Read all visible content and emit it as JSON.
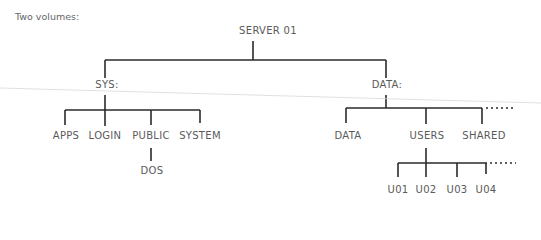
{
  "caption": "Two volumes:",
  "root": {
    "label": "SERVER 01"
  },
  "volumes": [
    {
      "label": "SYS:",
      "children": [
        {
          "label": "APPS"
        },
        {
          "label": "LOGIN"
        },
        {
          "label": "PUBLIC",
          "children": [
            {
              "label": "DOS"
            }
          ]
        },
        {
          "label": "SYSTEM"
        }
      ]
    },
    {
      "label": "DATA:",
      "children": [
        {
          "label": "DATA"
        },
        {
          "label": "USERS",
          "children": [
            {
              "label": "U01"
            },
            {
              "label": "U02"
            },
            {
              "label": "U03"
            },
            {
              "label": "U04"
            }
          ]
        },
        {
          "label": "SHARED"
        }
      ],
      "more_indicator": "dotted-continuation"
    }
  ],
  "colors": {
    "line": "#2a2a2a",
    "text": "#5a5a5a"
  }
}
